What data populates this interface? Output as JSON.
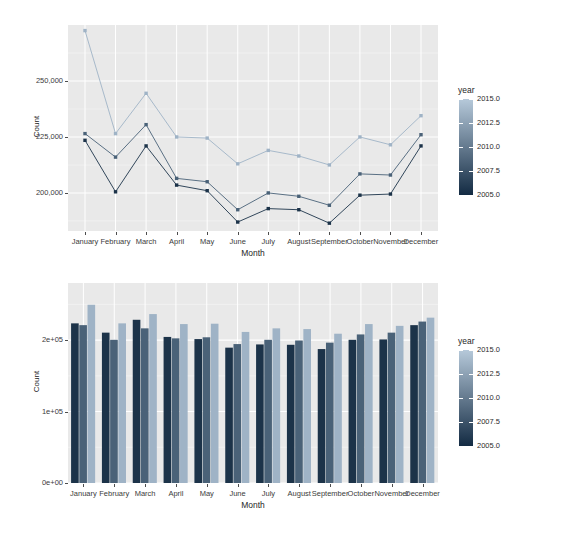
{
  "chart_data": [
    {
      "id": "line-chart",
      "type": "line",
      "title": "",
      "xlabel": "Month",
      "ylabel": "Count",
      "categories": [
        "January",
        "February",
        "March",
        "April",
        "May",
        "June",
        "July",
        "August",
        "September",
        "October",
        "November",
        "December"
      ],
      "xtick_labels": [
        "January",
        "February",
        "March",
        "April",
        "May",
        "June",
        "July",
        "August",
        "September",
        "October",
        "November",
        "December"
      ],
      "ytick_labels": [
        "250,000",
        "225,000",
        "200,000"
      ],
      "ytick_values": [
        250000,
        225000,
        200000
      ],
      "ylim": [
        183000,
        275000
      ],
      "grid": true,
      "legend": {
        "title": "year",
        "type": "continuous-colorbar",
        "labels": [
          "2015.0",
          "2012.5",
          "2010.0",
          "2007.5",
          "2005.0"
        ],
        "values": [
          2015.0,
          2012.5,
          2010.0,
          2007.5,
          2005.0
        ],
        "position": "right",
        "color_low": "#132b43",
        "color_high": "#b6c9da"
      },
      "series": [
        {
          "name": "2015",
          "year": 2015,
          "color": "#9fb3c6",
          "values": [
            272500,
            226500,
            244500,
            225000,
            224500,
            213000,
            219000,
            216500,
            212500,
            225000,
            221500,
            234500
          ]
        },
        {
          "name": "2010",
          "year": 2010,
          "color": "#4a6278",
          "values": [
            226500,
            216000,
            230500,
            206500,
            205000,
            192500,
            200000,
            198500,
            194500,
            208500,
            208000,
            226000
          ]
        },
        {
          "name": "2005",
          "year": 2005,
          "color": "#1c3349",
          "values": [
            223500,
            200500,
            221000,
            203500,
            201000,
            187000,
            193000,
            192500,
            186500,
            199000,
            199500,
            221000
          ]
        }
      ]
    },
    {
      "id": "bar-chart",
      "type": "bar",
      "title": "",
      "xlabel": "Month",
      "ylabel": "Count",
      "categories": [
        "January",
        "February",
        "March",
        "April",
        "May",
        "June",
        "July",
        "August",
        "September",
        "October",
        "November",
        "December"
      ],
      "xtick_labels": [
        "January",
        "February",
        "March",
        "April",
        "May",
        "June",
        "July",
        "August",
        "September",
        "October",
        "November",
        "December"
      ],
      "ytick_labels": [
        "2e+05",
        "1e+05",
        "0e+00"
      ],
      "ytick_values": [
        200000,
        100000,
        0
      ],
      "ylim": [
        0,
        280000
      ],
      "grid": true,
      "legend": {
        "title": "year",
        "type": "continuous-colorbar",
        "labels": [
          "2015.0",
          "2012.5",
          "2010.0",
          "2007.5",
          "2005.0"
        ],
        "values": [
          2015.0,
          2012.5,
          2010.0,
          2007.5,
          2005.0
        ],
        "position": "right",
        "color_low": "#132b43",
        "color_high": "#b6c9da"
      },
      "series": [
        {
          "name": "2005",
          "year": 2005,
          "color": "#1c3349",
          "values": [
            223500,
            210500,
            228500,
            204500,
            201500,
            189500,
            194000,
            193500,
            187500,
            200500,
            201000,
            221000
          ]
        },
        {
          "name": "2010",
          "year": 2010,
          "color": "#4a6278",
          "values": [
            221000,
            200500,
            216500,
            202500,
            204000,
            194500,
            200500,
            199500,
            196500,
            208000,
            210500,
            226000
          ]
        },
        {
          "name": "2015",
          "year": 2015,
          "color": "#9fb3c6",
          "values": [
            249500,
            223500,
            236500,
            222500,
            223000,
            211500,
            216500,
            215500,
            209000,
            222500,
            220000,
            231500
          ]
        }
      ]
    }
  ]
}
